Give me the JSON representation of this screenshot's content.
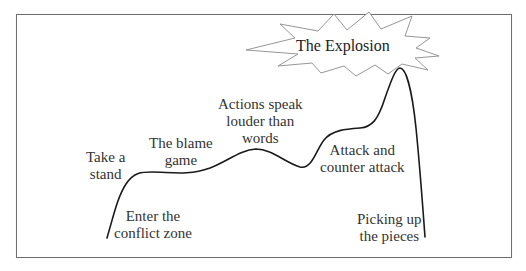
{
  "diagram": {
    "type": "conflict-escalation-curve",
    "frame_color": "#6e6e6e",
    "curve_color": "#1a1a1a",
    "starburst_stroke": "#7a7a7a",
    "stages": [
      {
        "id": "enter-the-conflict-zone",
        "lines": [
          "Enter the",
          "conflict zone"
        ]
      },
      {
        "id": "take-a-stand",
        "lines": [
          "Take a",
          "stand"
        ]
      },
      {
        "id": "the-blame-game",
        "lines": [
          "The blame",
          "game"
        ]
      },
      {
        "id": "actions-speak-louder-than-words",
        "lines": [
          "Actions speak",
          "louder than",
          "words"
        ]
      },
      {
        "id": "attack-and-counter-attack",
        "lines": [
          "Attack and",
          "counter attack"
        ]
      },
      {
        "id": "the-explosion",
        "lines": [
          "The Explosion"
        ]
      },
      {
        "id": "picking-up-the-pieces",
        "lines": [
          "Picking up",
          "the pieces"
        ]
      }
    ]
  }
}
